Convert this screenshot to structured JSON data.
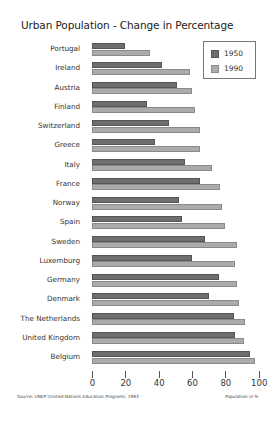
{
  "title": "Urban Population - Change in Percentage",
  "source": "Source: UNEP (United Nations Education Program), 1993",
  "unit_label": "Population in %",
  "legend": [
    {
      "label": "1950",
      "color": "#6e6e6e"
    },
    {
      "label": "1990",
      "color": "#ababab"
    }
  ],
  "colors": {
    "series_1950": "#6e6e6e",
    "series_1990": "#ababab",
    "legend_border": "#777777"
  },
  "x_axis": {
    "ticks": [
      "0",
      "20",
      "40",
      "60",
      "80",
      "100"
    ]
  },
  "chart_data": {
    "type": "bar",
    "orientation": "horizontal",
    "title": "Urban Population - Change in Percentage",
    "xlabel": "Population in %",
    "ylabel": "",
    "xlim": [
      0,
      100
    ],
    "x_ticks": [
      0,
      20,
      40,
      60,
      80,
      100
    ],
    "grid": false,
    "legend_position": "top-right",
    "categories": [
      "Portugal",
      "Ireland",
      "Austria",
      "Finland",
      "Switzerland",
      "Greece",
      "Italy",
      "France",
      "Norway",
      "Spain",
      "Sweden",
      "Luxemburg",
      "Germany",
      "Denmark",
      "The Netherlands",
      "United Kingdom",
      "Belgium"
    ],
    "series": [
      {
        "name": "1950",
        "values": [
          20,
          42,
          51,
          33,
          46,
          38,
          56,
          65,
          52,
          54,
          68,
          60,
          76,
          70,
          85,
          86,
          95
        ]
      },
      {
        "name": "1990",
        "values": [
          35,
          59,
          60,
          62,
          65,
          65,
          72,
          77,
          78,
          80,
          87,
          86,
          87,
          88,
          92,
          91,
          98
        ]
      }
    ],
    "annotations": [
      "Source: UNEP (United Nations Education Program), 1993"
    ]
  }
}
